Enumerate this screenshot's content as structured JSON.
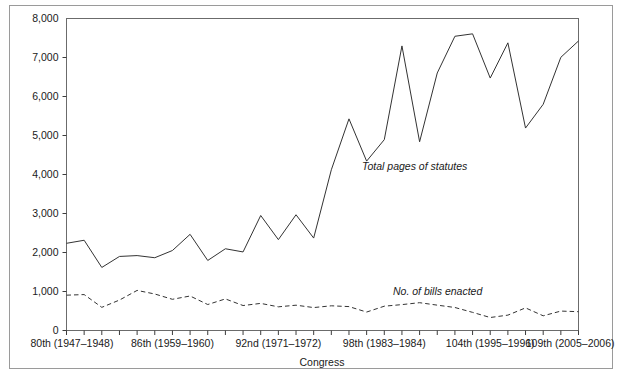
{
  "chart_data": {
    "type": "line",
    "title": "",
    "xlabel": "Congress",
    "ylabel": "",
    "ylim": [
      0,
      8000
    ],
    "grid": false,
    "legend_position": "inline-annotation",
    "y_ticks": [
      0,
      1000,
      2000,
      3000,
      4000,
      5000,
      6000,
      7000,
      8000
    ],
    "y_tick_labels": [
      "0",
      "1,000",
      "2,000",
      "3,000",
      "4,000",
      "5,000",
      "6,000",
      "7,000",
      "8,000"
    ],
    "categories": [
      "80th",
      "81st",
      "82nd",
      "83rd",
      "84th",
      "85th",
      "86th",
      "87th",
      "88th",
      "89th",
      "90th",
      "91st",
      "92nd",
      "93rd",
      "94th",
      "95th",
      "96th",
      "97th",
      "98th",
      "99th",
      "100th",
      "101st",
      "102nd",
      "103rd",
      "104th",
      "105th",
      "106th",
      "107th",
      "108th",
      "109th"
    ],
    "x_tick_labels": [
      {
        "index": 0,
        "label": "80th (1947–1948)"
      },
      {
        "index": 6,
        "label": "86th (1959–1960)"
      },
      {
        "index": 12,
        "label": "92nd (1971–1972)"
      },
      {
        "index": 18,
        "label": "98th (1983–1984)"
      },
      {
        "index": 24,
        "label": "104th (1995–1996)"
      },
      {
        "index": 29,
        "label": "109th (2005–2006)"
      }
    ],
    "series": [
      {
        "name": "Total pages of statutes",
        "style": "solid",
        "annotation": "Total pages of statutes",
        "values": [
          2236,
          2314,
          1617,
          1899,
          1921,
          1866,
          2051,
          2466,
          1796,
          2096,
          2014,
          2949,
          2330,
          2968,
          2370,
          4121,
          5427,
          4343,
          4893,
          7297,
          4839,
          6603,
          7544,
          7607,
          6473,
          7376,
          5191,
          5800,
          7005,
          7424
        ]
      },
      {
        "name": "No. of bills enacted",
        "style": "dashed",
        "annotation": "No. of bills enacted",
        "values": [
          906,
          921,
          594,
          781,
          1028,
          936,
          800,
          885,
          666,
          810,
          640,
          695,
          607,
          649,
          588,
          633,
          613,
          473,
          623,
          664,
          713,
          650,
          590,
          465,
          333,
          394,
          580,
          377,
          498,
          482
        ]
      }
    ]
  },
  "annotations": {
    "series_solid_label": "Total pages of statutes",
    "series_dashed_label": "No. of bills enacted"
  },
  "axes": {
    "x_title": "Congress"
  }
}
